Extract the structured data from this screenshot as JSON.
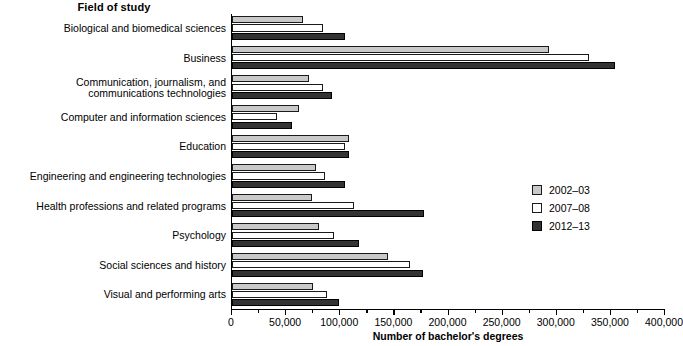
{
  "chart_data": {
    "type": "bar",
    "orientation": "horizontal",
    "title": "Field of study",
    "xlabel": "Number of bachelor's degrees",
    "ylabel": "Field of study",
    "xlim": [
      0,
      400000
    ],
    "xticks": [
      0,
      50000,
      100000,
      150000,
      200000,
      250000,
      300000,
      350000,
      400000
    ],
    "xtick_labels": [
      "0",
      "50,000",
      "100,000",
      "150,000",
      "200,000",
      "250,000",
      "300,000",
      "350,000",
      "400,000"
    ],
    "grid": false,
    "legend_position": "center right",
    "categories": [
      "Biological and biomedical sciences",
      "Business",
      "Communication, journalism, and\ncommunications technologies",
      "Computer and information sciences",
      "Education",
      "Engineering and engineering technologies",
      "Health professions and related programs",
      "Psychology",
      "Social sciences and history",
      "Visual and performing arts"
    ],
    "series": [
      {
        "name": "2002-03",
        "color": "#c9c9c9",
        "values": [
          66000,
          293000,
          71000,
          62000,
          108000,
          78000,
          74000,
          80000,
          144000,
          75000
        ]
      },
      {
        "name": "2007-08",
        "color": "#ffffff",
        "values": [
          84000,
          330000,
          84000,
          42000,
          104000,
          86000,
          113000,
          94000,
          164000,
          88000
        ]
      },
      {
        "name": "2012-13",
        "color": "#333333",
        "values": [
          104000,
          354000,
          92000,
          55000,
          108000,
          104000,
          177000,
          117000,
          176000,
          99000
        ]
      }
    ]
  },
  "legend": {
    "items": [
      {
        "label": "2002–03"
      },
      {
        "label": "2007–08"
      },
      {
        "label": "2012–13"
      }
    ]
  }
}
